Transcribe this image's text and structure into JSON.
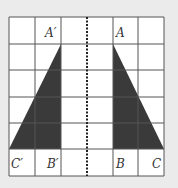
{
  "diagram": {
    "type": "reflection",
    "grid": {
      "cols": 6,
      "rows": 6,
      "x0": 9,
      "y0": 17,
      "x1": 164,
      "y1": 176
    },
    "mirror_line": {
      "style": "dotted",
      "x": 87
    },
    "colors": {
      "background": "#ebebeb",
      "cell": "#ffffff",
      "grid_line": "#555555",
      "fill": "#3a3a3a"
    },
    "triangles": [
      {
        "name": "ABC",
        "points": [
          [
            113,
            44
          ],
          [
            113,
            149
          ],
          [
            164,
            149
          ]
        ]
      },
      {
        "name": "A'B'C'",
        "points": [
          [
            61,
            44
          ],
          [
            61,
            149
          ],
          [
            9,
            149
          ]
        ]
      }
    ],
    "labels": {
      "A_prime": "A′",
      "A": "A",
      "C_prime": "C′",
      "B_prime": "B′",
      "B": "B",
      "C": "C"
    }
  }
}
